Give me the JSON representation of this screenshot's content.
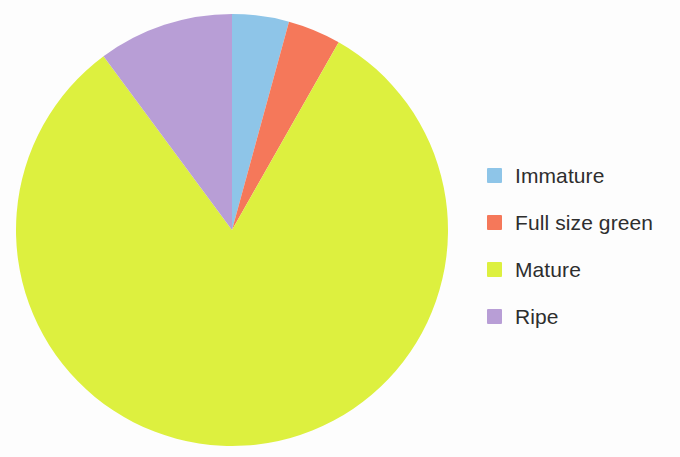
{
  "chart_data": {
    "type": "pie",
    "title": "",
    "subtitle": "",
    "xlabel": "",
    "ylabel": "",
    "legend_position": "right",
    "grid": false,
    "start_angle_deg": 0,
    "direction": "clockwise",
    "categories": [
      "Immature",
      "Full size green",
      "Mature",
      "Ripe"
    ],
    "values": [
      4.3,
      4.0,
      81.6,
      10.1
    ],
    "units": "percent",
    "colors": [
      "#8ec5e8",
      "#f5785a",
      "#ddf03f",
      "#b89ed6"
    ],
    "slices": [
      {
        "label": "Immature",
        "value": 4.3,
        "color": "#8ec5e8",
        "start_deg": 0.0,
        "end_deg": 15.3
      },
      {
        "label": "Full size green",
        "value": 4.0,
        "color": "#f5785a",
        "start_deg": 15.3,
        "end_deg": 29.6
      },
      {
        "label": "Mature",
        "value": 81.6,
        "color": "#ddf03f",
        "start_deg": 29.6,
        "end_deg": 323.5
      },
      {
        "label": "Ripe",
        "value": 10.1,
        "color": "#b89ed6",
        "start_deg": 323.5,
        "end_deg": 360.0
      }
    ]
  },
  "pie": {
    "center_x": 232,
    "center_y": 230,
    "radius": 216
  },
  "legend": {
    "items": [
      {
        "label": "Immature",
        "color": "#8ec5e8",
        "swatch_name": "legend-swatch-immature"
      },
      {
        "label": "Full size green",
        "color": "#f5785a",
        "swatch_name": "legend-swatch-full-size-green"
      },
      {
        "label": "Mature",
        "color": "#ddf03f",
        "swatch_name": "legend-swatch-mature"
      },
      {
        "label": "Ripe",
        "color": "#b89ed6",
        "swatch_name": "legend-swatch-ripe"
      }
    ]
  },
  "background_color": "#fdfdfd"
}
